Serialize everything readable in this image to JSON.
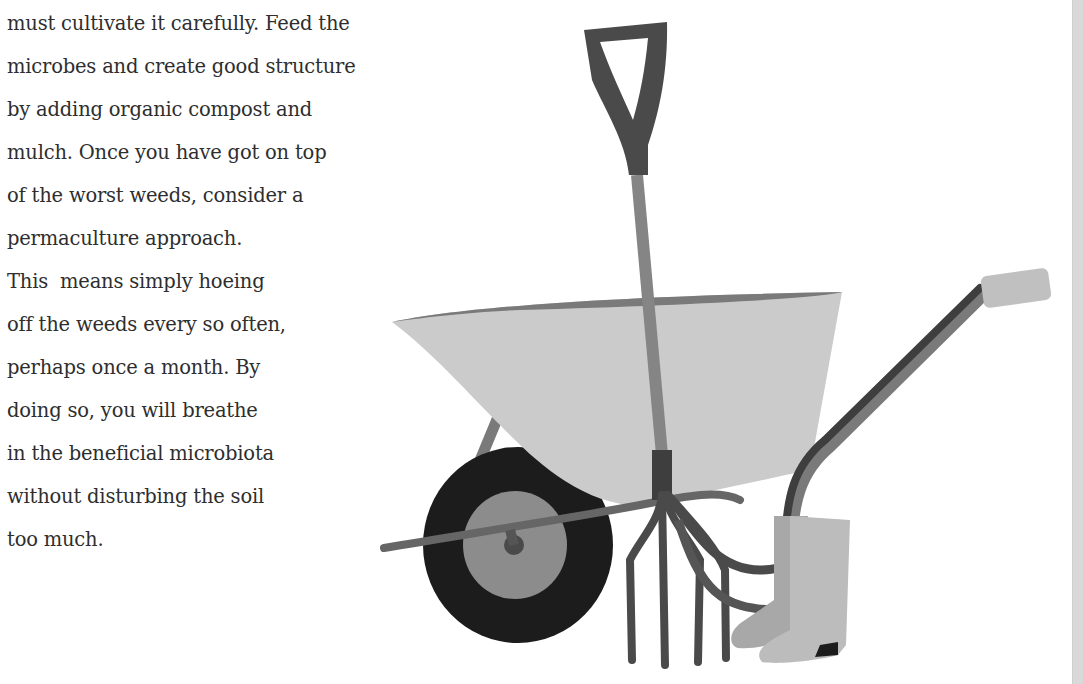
{
  "article": {
    "lines": [
      "must cultivate it carefully. Feed the",
      "microbes and create good structure",
      "by adding organic compost and",
      "mulch. Once you have got on top",
      "of the worst weeds, consider a",
      "permaculture approach.",
      "This  means simply hoeing",
      "off the weeds every so often,",
      "perhaps once a month. By",
      "doing so, you will breathe",
      "in the beneficial microbiota",
      "without disturbing the soil",
      "too much."
    ]
  },
  "illustration": {
    "subject": "garden tools: wheelbarrow, spade, fork, wellington boots",
    "colors": {
      "dark": "#4a4a4a",
      "mid": "#7a7a7a",
      "light": "#c8c8c8",
      "tyre": "#1c1c1c",
      "hub": "#8c8c8c"
    }
  }
}
